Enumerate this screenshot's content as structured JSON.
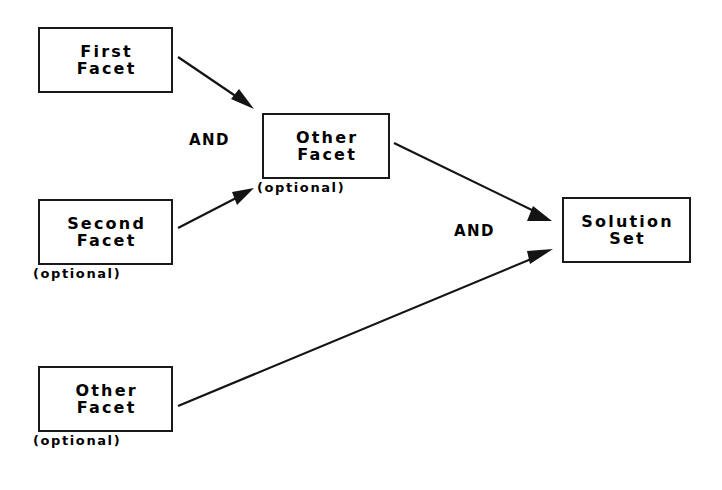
{
  "diagram": {
    "background_color": "#ffffff",
    "stroke_color": "#141414",
    "nodes": [
      {
        "id": "first-facet",
        "lines": [
          "First",
          "Facet"
        ],
        "line1": "First",
        "line2": "Facet",
        "caption": "",
        "x": 38,
        "y": 27,
        "w": 135,
        "h": 66
      },
      {
        "id": "other-facet-middle",
        "lines": [
          "Other",
          "Facet"
        ],
        "line1": "Other",
        "line2": "Facet",
        "caption": "(optional)",
        "x": 262,
        "y": 113,
        "w": 128,
        "h": 66
      },
      {
        "id": "second-facet",
        "lines": [
          "Second",
          "Facet"
        ],
        "line1": "Second",
        "line2": "Facet",
        "caption": "(optional)",
        "x": 38,
        "y": 199,
        "w": 135,
        "h": 66
      },
      {
        "id": "other-facet-bottom",
        "lines": [
          "Other",
          "Facet"
        ],
        "line1": "Other",
        "line2": "Facet",
        "caption": "(optional)",
        "x": 38,
        "y": 366,
        "w": 135,
        "h": 66
      },
      {
        "id": "solution-set",
        "lines": [
          "Solution",
          "Set"
        ],
        "line1": "Solution",
        "line2": "Set",
        "caption": "",
        "x": 562,
        "y": 197,
        "w": 129,
        "h": 66
      }
    ],
    "captions": [
      {
        "id": "caption-other-facet-middle",
        "text": "(optional)",
        "x": 257,
        "y": 180
      },
      {
        "id": "caption-second-facet",
        "text": "(optional)",
        "x": 33,
        "y": 266
      },
      {
        "id": "caption-other-facet-bottom",
        "text": "(optional)",
        "x": 33,
        "y": 433
      }
    ],
    "operators": [
      {
        "id": "and-upper",
        "text": "AND",
        "x": 189,
        "y": 131
      },
      {
        "id": "and-lower",
        "text": "AND",
        "x": 454,
        "y": 222
      }
    ],
    "edges": [
      {
        "id": "edge-first-to-other",
        "from": "first-facet",
        "to": "other-facet-middle",
        "operator": "AND",
        "arrowhead": "solid-triangle"
      },
      {
        "id": "edge-second-to-other",
        "from": "second-facet",
        "to": "other-facet-middle",
        "operator": "AND",
        "arrowhead": "solid-triangle"
      },
      {
        "id": "edge-other-to-solution",
        "from": "other-facet-middle",
        "to": "solution-set",
        "operator": "AND",
        "arrowhead": "solid-triangle"
      },
      {
        "id": "edge-bottom-to-solution",
        "from": "other-facet-bottom",
        "to": "solution-set",
        "operator": "AND",
        "arrowhead": "solid-triangle"
      }
    ]
  }
}
